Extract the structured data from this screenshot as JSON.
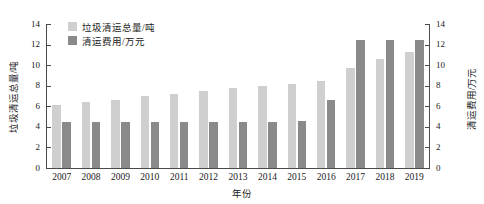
{
  "chart_data": {
    "type": "bar",
    "title": "",
    "xlabel": "年份",
    "ylabel": "垃圾清运总量/吨",
    "ylabel_right": "清运费用/万元",
    "categories": [
      "2007",
      "2008",
      "2009",
      "2010",
      "2011",
      "2012",
      "2013",
      "2014",
      "2015",
      "2016",
      "2017",
      "2018",
      "2019"
    ],
    "ylim": [
      0,
      14
    ],
    "ylim_right": [
      0,
      14
    ],
    "yticks": [
      0,
      2,
      4,
      6,
      8,
      10,
      12,
      14
    ],
    "yticks_right": [
      0,
      2,
      4,
      6,
      8,
      10,
      12,
      14
    ],
    "grid": false,
    "legend_position": "upper-left",
    "series": [
      {
        "name": "垃圾清运总量/吨",
        "axis": "left",
        "color": "#cfcfcf",
        "values": [
          6.1,
          6.4,
          6.6,
          7.0,
          7.2,
          7.5,
          7.8,
          8.0,
          8.2,
          8.5,
          9.7,
          10.6,
          11.3
        ]
      },
      {
        "name": "清运费用/万元",
        "axis": "right",
        "color": "#8a8a8a",
        "values": [
          4.5,
          4.5,
          4.5,
          4.5,
          4.5,
          4.5,
          4.5,
          4.5,
          4.6,
          6.6,
          12.4,
          12.4,
          12.4
        ]
      }
    ]
  },
  "legend": {
    "items": [
      {
        "label": "垃圾清运总量/吨",
        "color": "#cfcfcf"
      },
      {
        "label": "清运费用/万元",
        "color": "#8a8a8a"
      }
    ]
  },
  "axes": {
    "left_title": "垃圾清运总量/吨",
    "right_title": "清运费用/万元",
    "x_title": "年份"
  }
}
